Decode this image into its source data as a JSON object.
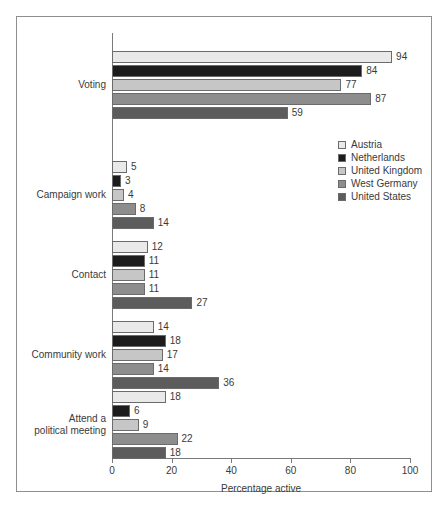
{
  "chart_data": {
    "type": "bar",
    "orientation": "horizontal",
    "title": "",
    "xlabel": "Percentage active",
    "ylabel": "",
    "xlim": [
      0,
      100
    ],
    "xticks": [
      0,
      20,
      40,
      60,
      80,
      100
    ],
    "grid": false,
    "legend_position": "middle-right",
    "categories": [
      "Voting",
      "Campaign work",
      "Contact",
      "Community work",
      "Attend a\npolitical meeting"
    ],
    "series": [
      {
        "name": "Austria",
        "color": "#e9e9e9",
        "values": [
          94,
          5,
          12,
          14,
          18
        ]
      },
      {
        "name": "Netherlands",
        "color": "#1c1c1c",
        "values": [
          84,
          3,
          11,
          18,
          6
        ]
      },
      {
        "name": "United Kingdom",
        "color": "#c6c6c6",
        "values": [
          77,
          4,
          11,
          17,
          9
        ]
      },
      {
        "name": "West Germany",
        "color": "#8d8d8d",
        "values": [
          87,
          8,
          11,
          14,
          22
        ]
      },
      {
        "name": "United States",
        "color": "#5c5c5c",
        "values": [
          59,
          14,
          27,
          36,
          18
        ]
      }
    ]
  },
  "axis": {
    "tick_labels": [
      "0",
      "20",
      "40",
      "60",
      "80",
      "100"
    ],
    "x_title": "Percentage active"
  },
  "legend": {
    "items": [
      {
        "label": "Austria",
        "color": "#e9e9e9"
      },
      {
        "label": "Netherlands",
        "color": "#1c1c1c"
      },
      {
        "label": "United Kingdom",
        "color": "#c6c6c6"
      },
      {
        "label": "West Germany",
        "color": "#8d8d8d"
      },
      {
        "label": "United States",
        "color": "#5c5c5c"
      }
    ]
  }
}
